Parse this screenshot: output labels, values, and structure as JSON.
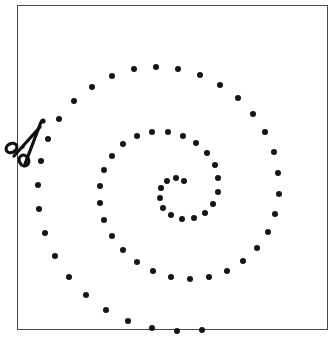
{
  "figure": {
    "background_color": "#ffffff",
    "dot_color": "#151515",
    "frame_color": "#4a4a4a"
  },
  "frame": {
    "name": "page-border",
    "x": 17,
    "y": 5,
    "width": 311,
    "height": 325,
    "stroke_width": 1
  },
  "scissors": {
    "name": "scissors-cut-marker",
    "x": 8,
    "y": 118,
    "width": 40,
    "height": 48,
    "rotation_deg": 135,
    "color": "#101010",
    "icon": "scissors-icon"
  },
  "chart_data": {
    "type": "scatter",
    "subtitle": "",
    "xlabel": "",
    "ylabel": "",
    "grid": false,
    "legend": null,
    "xlim": [
      17,
      328
    ],
    "ylim": [
      5,
      330
    ],
    "annotations": [
      {
        "label": "scissors-cut-marker",
        "x": 28,
        "y": 142
      }
    ],
    "spiral": {
      "kind": "archimedean",
      "center_x": 178,
      "center_y": 185,
      "a": 6.0,
      "b": 11.6,
      "theta_start_deg": 10,
      "theta_end_deg": 890,
      "turns": 2.44,
      "dot_diameter": 6,
      "dot_count": 66,
      "direction": "counterclockwise-outward"
    },
    "points": [
      [
        184,
        181
      ],
      [
        176,
        178
      ],
      [
        167,
        181
      ],
      [
        161,
        188
      ],
      [
        160,
        198
      ],
      [
        163,
        208
      ],
      [
        171,
        215
      ],
      [
        182,
        219
      ],
      [
        194,
        218
      ],
      [
        205,
        213
      ],
      [
        213,
        204
      ],
      [
        218,
        192
      ],
      [
        218,
        178
      ],
      [
        215,
        165
      ],
      [
        207,
        153
      ],
      [
        196,
        143
      ],
      [
        183,
        136
      ],
      [
        168,
        132
      ],
      [
        152,
        132
      ],
      [
        137,
        136
      ],
      [
        123,
        144
      ],
      [
        112,
        156
      ],
      [
        104,
        170
      ],
      [
        100,
        186
      ],
      [
        100,
        203
      ],
      [
        104,
        220
      ],
      [
        112,
        236
      ],
      [
        123,
        250
      ],
      [
        137,
        262
      ],
      [
        153,
        271
      ],
      [
        171,
        277
      ],
      [
        190,
        279
      ],
      [
        209,
        277
      ],
      [
        227,
        271
      ],
      [
        243,
        261
      ],
      [
        257,
        248
      ],
      [
        268,
        232
      ],
      [
        275,
        214
      ],
      [
        279,
        194
      ],
      [
        278,
        173
      ],
      [
        274,
        152
      ],
      [
        265,
        132
      ],
      [
        253,
        114
      ],
      [
        238,
        98
      ],
      [
        220,
        85
      ],
      [
        200,
        75
      ],
      [
        178,
        69
      ],
      [
        156,
        67
      ],
      [
        134,
        69
      ],
      [
        112,
        76
      ],
      [
        92,
        87
      ],
      [
        74,
        101
      ],
      [
        59,
        119
      ],
      [
        48,
        139
      ],
      [
        41,
        161
      ],
      [
        38,
        185
      ],
      [
        39,
        209
      ],
      [
        45,
        233
      ],
      [
        55,
        256
      ],
      [
        69,
        277
      ],
      [
        86,
        295
      ],
      [
        106,
        310
      ],
      [
        128,
        321
      ],
      [
        152,
        328
      ],
      [
        177,
        331
      ],
      [
        202,
        330
      ]
    ]
  }
}
